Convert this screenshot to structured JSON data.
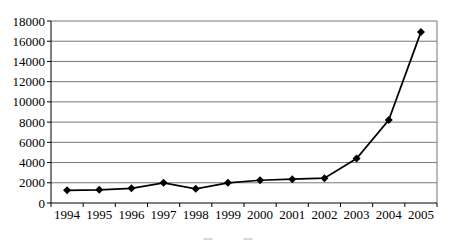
{
  "chart_data": {
    "type": "line",
    "title": "",
    "xlabel": "",
    "ylabel": "",
    "categories": [
      "1994",
      "1995",
      "1996",
      "1997",
      "1998",
      "1999",
      "2000",
      "2001",
      "2002",
      "2003",
      "2004",
      "2005"
    ],
    "series": [
      {
        "name": "",
        "values": [
          1250,
          1300,
          1450,
          2000,
          1400,
          2000,
          2250,
          2350,
          2450,
          4400,
          8200,
          16900
        ]
      }
    ],
    "ylim": [
      0,
      18000
    ],
    "ytick_step": 2000,
    "yticks": [
      0,
      2000,
      4000,
      6000,
      8000,
      10000,
      12000,
      14000,
      16000,
      18000
    ],
    "grid": true,
    "legend_position": "none",
    "marker": "diamond",
    "colors": {
      "line": "#000000",
      "marker": "#000000",
      "gridline": "#777777",
      "axis": "#000000",
      "tick_label": "#000000",
      "background": "#ffffff"
    }
  }
}
